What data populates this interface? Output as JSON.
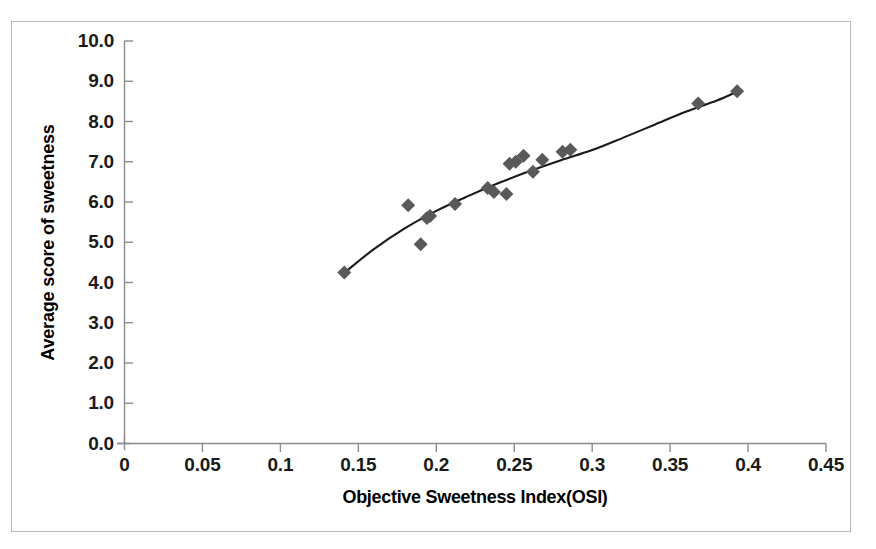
{
  "chart_data": {
    "type": "scatter",
    "title": "",
    "xlabel": "Objective Sweetness Index(OSI)",
    "ylabel": "Average score of sweetness",
    "xlim": [
      0,
      0.45
    ],
    "ylim": [
      0,
      10
    ],
    "grid": false,
    "legend": null,
    "marker": {
      "shape": "diamond",
      "color": "#595959",
      "size": 13
    },
    "trendline": {
      "present": true,
      "style": "solid",
      "color": "#1a1a1a",
      "description": "smooth increasing curve (logarithmic/concave) through the points"
    },
    "xticks": [
      0,
      0.05,
      0.1,
      0.15,
      0.2,
      0.25,
      0.3,
      0.35,
      0.4,
      0.45
    ],
    "xtick_labels": [
      "0",
      "0.05",
      "0.1",
      "0.15",
      "0.2",
      "0.25",
      "0.3",
      "0.35",
      "0.4",
      "0.45"
    ],
    "yticks": [
      0,
      1,
      2,
      3,
      4,
      5,
      6,
      7,
      8,
      9,
      10
    ],
    "ytick_labels": [
      "0.0",
      "1.0",
      "2.0",
      "3.0",
      "4.0",
      "5.0",
      "6.0",
      "7.0",
      "8.0",
      "9.0",
      "10.0"
    ],
    "points": [
      {
        "x": 0.141,
        "y": 4.25
      },
      {
        "x": 0.182,
        "y": 5.92
      },
      {
        "x": 0.19,
        "y": 4.95
      },
      {
        "x": 0.194,
        "y": 5.6
      },
      {
        "x": 0.196,
        "y": 5.65
      },
      {
        "x": 0.212,
        "y": 5.95
      },
      {
        "x": 0.233,
        "y": 6.35
      },
      {
        "x": 0.237,
        "y": 6.25
      },
      {
        "x": 0.245,
        "y": 6.2
      },
      {
        "x": 0.247,
        "y": 6.95
      },
      {
        "x": 0.251,
        "y": 7.0
      },
      {
        "x": 0.256,
        "y": 7.15
      },
      {
        "x": 0.262,
        "y": 6.75
      },
      {
        "x": 0.268,
        "y": 7.05
      },
      {
        "x": 0.281,
        "y": 7.25
      },
      {
        "x": 0.286,
        "y": 7.3
      },
      {
        "x": 0.368,
        "y": 8.45
      },
      {
        "x": 0.393,
        "y": 8.75
      }
    ],
    "curve": [
      {
        "x": 0.141,
        "y": 4.24
      },
      {
        "x": 0.16,
        "y": 4.83
      },
      {
        "x": 0.18,
        "y": 5.35
      },
      {
        "x": 0.2,
        "y": 5.78
      },
      {
        "x": 0.22,
        "y": 6.14
      },
      {
        "x": 0.24,
        "y": 6.47
      },
      {
        "x": 0.26,
        "y": 6.77
      },
      {
        "x": 0.28,
        "y": 7.04
      },
      {
        "x": 0.3,
        "y": 7.29
      },
      {
        "x": 0.32,
        "y": 7.6
      },
      {
        "x": 0.34,
        "y": 7.92
      },
      {
        "x": 0.36,
        "y": 8.24
      },
      {
        "x": 0.38,
        "y": 8.52
      },
      {
        "x": 0.393,
        "y": 8.74
      }
    ]
  },
  "axes": {
    "y_title": "Average score of sweetness",
    "x_title": "Objective Sweetness Index(OSI)"
  }
}
